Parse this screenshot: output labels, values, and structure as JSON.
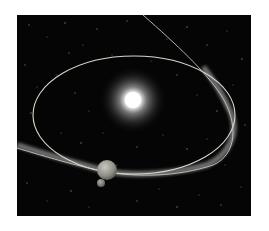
{
  "image": {
    "description": "Space illustration: bright sun at center, elliptical planetary orbit, comet path crossing the orbit with a dusty debris trail, and a small planet with a moon near the bottom of the orbit",
    "background_color": "#050505",
    "frame_color": "#ffffff",
    "elements": {
      "sun": {
        "label": "sun",
        "color": "#ffffff"
      },
      "orbit": {
        "label": "planetary orbit",
        "color": "#d8d8c8"
      },
      "comet_path": {
        "label": "comet orbit",
        "color": "#bfbfbf"
      },
      "debris_trail": {
        "label": "meteoroid debris stream",
        "color": "#9a9a9a"
      },
      "planet": {
        "label": "planet",
        "color": "#9c9c94"
      },
      "moon": {
        "label": "moon",
        "color": "#8a8a86"
      }
    }
  }
}
